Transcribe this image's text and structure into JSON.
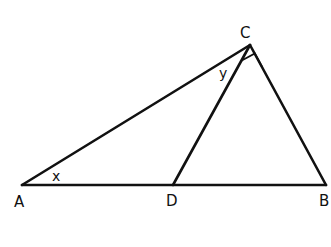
{
  "diagram": {
    "type": "triangle-geometry",
    "points": {
      "A": {
        "label": "A",
        "x": 22,
        "y": 185
      },
      "D": {
        "label": "D",
        "x": 173,
        "y": 185
      },
      "B": {
        "label": "B",
        "x": 326,
        "y": 185
      },
      "C": {
        "label": "C",
        "x": 250,
        "y": 45
      }
    },
    "segments": [
      "AC",
      "CB",
      "AB",
      "CD"
    ],
    "angles": {
      "x": {
        "label": "x",
        "vertex": "A"
      },
      "y": {
        "label": "y",
        "vertex": "C",
        "between": "CA and CD"
      }
    },
    "right_angle": {
      "vertex": "C",
      "between": "CD and CB"
    },
    "stroke_color": "#111111"
  }
}
